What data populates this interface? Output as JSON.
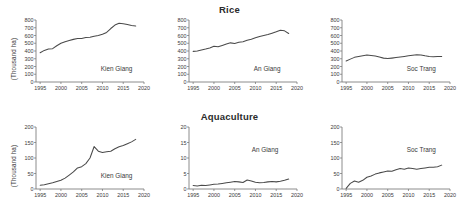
{
  "figure": {
    "rows": [
      {
        "title": "Rice",
        "ylabel": "(Thousand ha)"
      },
      {
        "title": "Aquaculture",
        "ylabel": "(Thousand ha)"
      }
    ]
  },
  "chart_data": [
    {
      "type": "line",
      "title": "Rice",
      "panel_label": "Kien Giang",
      "xlabel": "",
      "ylabel": "(Thousand ha)",
      "xlim": [
        1994,
        2020
      ],
      "ylim": [
        0,
        800
      ],
      "xticks": [
        1995,
        2000,
        2005,
        2010,
        2015,
        2020
      ],
      "yticks": [
        0,
        100,
        200,
        300,
        400,
        500,
        600,
        700,
        800
      ],
      "grid": false,
      "legend": "none",
      "x": [
        1995,
        1996,
        1997,
        1998,
        1999,
        2000,
        2001,
        2002,
        2003,
        2004,
        2005,
        2006,
        2007,
        2008,
        2009,
        2010,
        2011,
        2012,
        2013,
        2014,
        2015,
        2016,
        2017,
        2018
      ],
      "values": [
        378,
        408,
        425,
        430,
        468,
        500,
        520,
        535,
        550,
        560,
        562,
        575,
        578,
        590,
        600,
        615,
        640,
        690,
        735,
        758,
        752,
        742,
        730,
        722
      ]
    },
    {
      "type": "line",
      "title": "Rice",
      "panel_label": "An Giang",
      "xlabel": "",
      "ylabel": "",
      "xlim": [
        1994,
        2020
      ],
      "ylim": [
        0,
        800
      ],
      "xticks": [
        1995,
        2000,
        2005,
        2010,
        2015,
        2020
      ],
      "yticks": [
        0,
        100,
        200,
        300,
        400,
        500,
        600,
        700,
        800
      ],
      "grid": false,
      "legend": "none",
      "x": [
        1995,
        1996,
        1997,
        1998,
        1999,
        2000,
        2001,
        2002,
        2003,
        2004,
        2005,
        2006,
        2007,
        2008,
        2009,
        2010,
        2011,
        2012,
        2013,
        2014,
        2015,
        2016,
        2017,
        2018
      ],
      "values": [
        395,
        400,
        412,
        425,
        440,
        462,
        455,
        472,
        490,
        505,
        498,
        512,
        520,
        538,
        552,
        570,
        588,
        600,
        612,
        630,
        648,
        668,
        660,
        625
      ]
    },
    {
      "type": "line",
      "title": "Rice",
      "panel_label": "Soc Trang",
      "xlabel": "",
      "ylabel": "",
      "xlim": [
        1994,
        2020
      ],
      "ylim": [
        0,
        800
      ],
      "xticks": [
        1995,
        2000,
        2005,
        2010,
        2015,
        2020
      ],
      "yticks": [
        0,
        100,
        200,
        300,
        400,
        500,
        600,
        700,
        800
      ],
      "grid": false,
      "legend": "none",
      "x": [
        1995,
        1996,
        1997,
        1998,
        1999,
        2000,
        2001,
        2002,
        2003,
        2004,
        2005,
        2006,
        2007,
        2008,
        2009,
        2010,
        2011,
        2012,
        2013,
        2014,
        2015,
        2016,
        2017,
        2018
      ],
      "values": [
        272,
        295,
        318,
        330,
        340,
        348,
        342,
        335,
        322,
        308,
        302,
        308,
        315,
        322,
        330,
        338,
        345,
        352,
        348,
        338,
        330,
        325,
        330,
        328
      ]
    },
    {
      "type": "line",
      "title": "Aquaculture",
      "panel_label": "Kien Giang",
      "xlabel": "",
      "ylabel": "(Thousand ha)",
      "xlim": [
        1994,
        2020
      ],
      "ylim": [
        0,
        200
      ],
      "xticks": [
        1995,
        2000,
        2005,
        2010,
        2015,
        2020
      ],
      "yticks": [
        0,
        50,
        100,
        150,
        200
      ],
      "grid": false,
      "legend": "none",
      "x": [
        1995,
        1996,
        1997,
        1998,
        1999,
        2000,
        2001,
        2002,
        2003,
        2004,
        2005,
        2006,
        2007,
        2008,
        2009,
        2010,
        2011,
        2012,
        2013,
        2014,
        2015,
        2016,
        2017,
        2018
      ],
      "values": [
        12,
        14,
        17,
        20,
        24,
        28,
        35,
        45,
        55,
        68,
        72,
        82,
        100,
        137,
        122,
        118,
        120,
        122,
        130,
        136,
        140,
        146,
        152,
        160
      ]
    },
    {
      "type": "line",
      "title": "Aquaculture",
      "panel_label": "An Giang",
      "xlabel": "",
      "ylabel": "",
      "xlim": [
        1994,
        2020
      ],
      "ylim": [
        0,
        20
      ],
      "xticks": [
        1995,
        2000,
        2005,
        2010,
        2015,
        2020
      ],
      "yticks": [
        0,
        5,
        10,
        15,
        20
      ],
      "grid": false,
      "legend": "none",
      "x": [
        1995,
        1996,
        1997,
        1998,
        1999,
        2000,
        2001,
        2002,
        2003,
        2004,
        2005,
        2006,
        2007,
        2008,
        2009,
        2010,
        2011,
        2012,
        2013,
        2014,
        2015,
        2016,
        2017,
        2018
      ],
      "values": [
        1.1,
        1.0,
        1.2,
        1.1,
        1.3,
        1.5,
        1.6,
        1.8,
        2.0,
        2.2,
        2.4,
        2.3,
        2.1,
        2.9,
        2.6,
        2.2,
        2.0,
        2.1,
        2.3,
        2.4,
        2.3,
        2.5,
        2.8,
        3.2
      ]
    },
    {
      "type": "line",
      "title": "Aquaculture",
      "panel_label": "Soc Trang",
      "xlabel": "",
      "ylabel": "",
      "xlim": [
        1994,
        2020
      ],
      "ylim": [
        0,
        200
      ],
      "xticks": [
        1995,
        2000,
        2005,
        2010,
        2015,
        2020
      ],
      "yticks": [
        0,
        50,
        100,
        150,
        200
      ],
      "grid": false,
      "legend": "none",
      "x": [
        1995,
        1996,
        1997,
        1998,
        1999,
        2000,
        2001,
        2002,
        2003,
        2004,
        2005,
        2006,
        2007,
        2008,
        2009,
        2010,
        2011,
        2012,
        2013,
        2014,
        2015,
        2016,
        2017,
        2018
      ],
      "values": [
        2,
        18,
        26,
        22,
        28,
        38,
        42,
        48,
        52,
        55,
        58,
        57,
        62,
        66,
        64,
        68,
        66,
        64,
        66,
        68,
        70,
        70,
        72,
        77
      ]
    }
  ]
}
